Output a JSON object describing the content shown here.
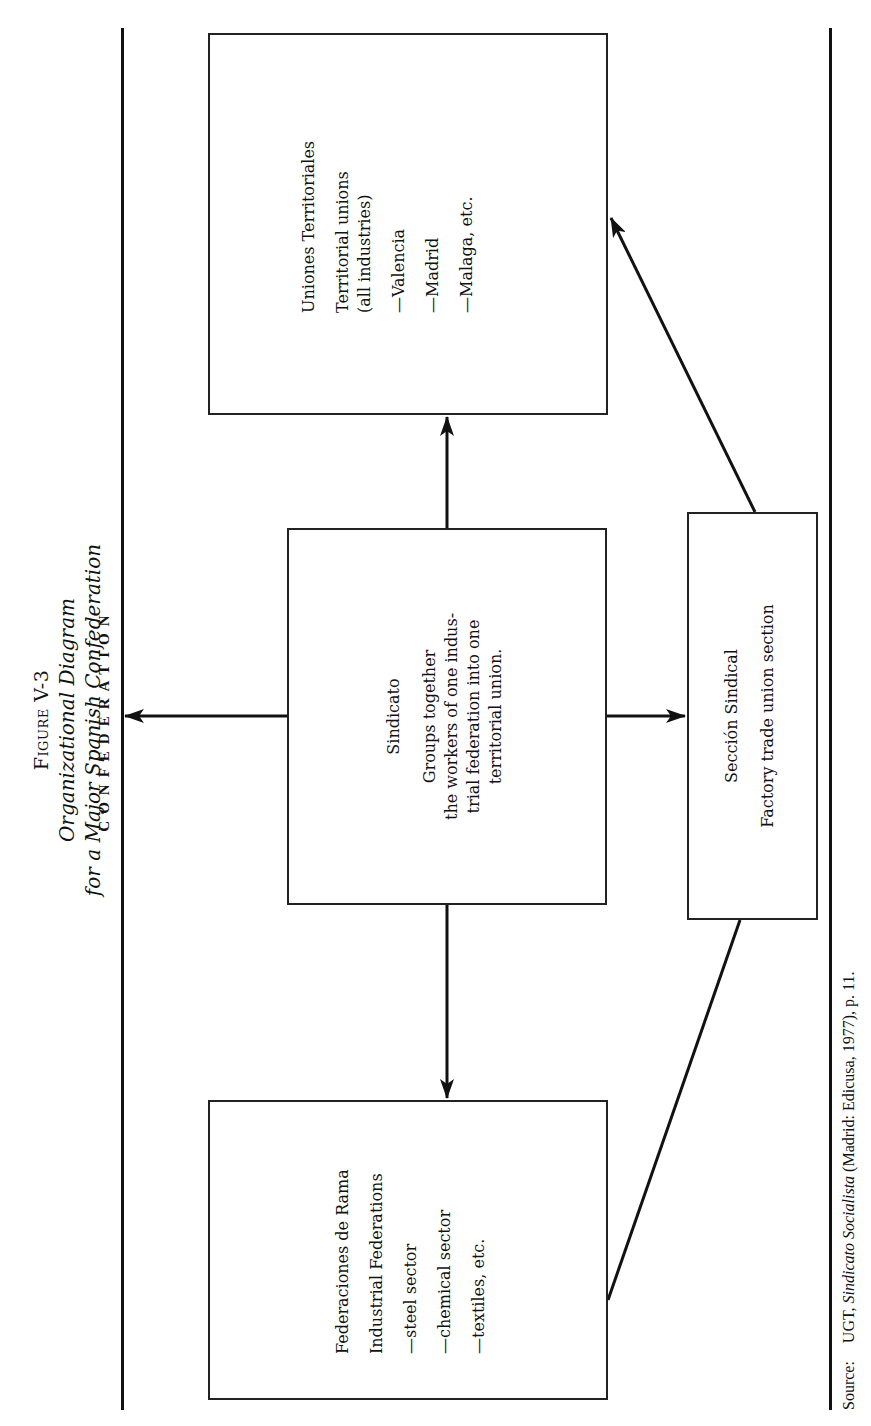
{
  "figure": {
    "label": "Figure V-3",
    "title_line1": "Organizational Diagram",
    "title_line2": "for a Major Spanish Confederation"
  },
  "confederation": {
    "label": "CONFEDERATION"
  },
  "nodes": {
    "uniones": {
      "heading": "Uniones Territoriales",
      "subheading_line1": "Territorial unions",
      "subheading_line2": "(all industries)",
      "items": [
        "—Valencia",
        "—Madrid",
        "—Malaga, etc."
      ]
    },
    "sindicato": {
      "heading": "Sindicato",
      "desc_lines": [
        "Groups together",
        "the workers of one indus-",
        "trial federation into one",
        "territorial union."
      ]
    },
    "federaciones": {
      "heading": "Federaciones de Rama",
      "subheading": "Industrial Federations",
      "items": [
        "—steel sector",
        "—chemical sector",
        "—textiles, etc."
      ]
    },
    "seccion": {
      "heading": "Sección Sindical",
      "subheading": "Factory trade union section"
    }
  },
  "edges": [
    {
      "from": "sindicato",
      "to": "confederation",
      "arrow": "end"
    },
    {
      "from": "sindicato",
      "to": "uniones",
      "arrow": "end"
    },
    {
      "from": "sindicato",
      "to": "federaciones",
      "arrow": "end"
    },
    {
      "from": "sindicato",
      "to": "seccion",
      "arrow": "end"
    },
    {
      "from": "seccion",
      "to": "uniones",
      "arrow": "end"
    },
    {
      "from": "seccion",
      "to": "federaciones",
      "arrow": "none"
    }
  ],
  "source": {
    "prefix": "Source:",
    "author": "UGT,",
    "work": "Sindicato Socialista",
    "rest": "(Madrid: Edicusa, 1977), p. 11."
  },
  "colors": {
    "ink": "#111111",
    "paper": "#ffffff"
  }
}
